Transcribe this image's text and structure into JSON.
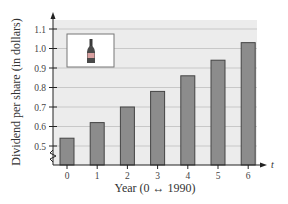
{
  "chart_data": {
    "type": "bar",
    "title": "",
    "xlabel": "Year (0 ↔ 1990)",
    "ylabel": "Dividend per share (in dollars)",
    "x_axis_variable": "t",
    "categories": [
      "0",
      "1",
      "2",
      "3",
      "4",
      "5",
      "6"
    ],
    "values": [
      0.54,
      0.62,
      0.7,
      0.78,
      0.86,
      0.94,
      1.03
    ],
    "y_ticks": [
      "0.5",
      "0.6",
      "0.7",
      "0.8",
      "0.9",
      "1.0",
      "1.1"
    ],
    "ylim": [
      0.4,
      1.15
    ],
    "axis_break": true,
    "grid": true,
    "legend": {
      "icon": "bottle-icon",
      "position": "upper-left"
    },
    "colors": {
      "bar_fill": "#8c8c8c",
      "bar_stroke": "#444444",
      "plot_bg": "#ececec",
      "grid": "#c8c8c8"
    }
  }
}
